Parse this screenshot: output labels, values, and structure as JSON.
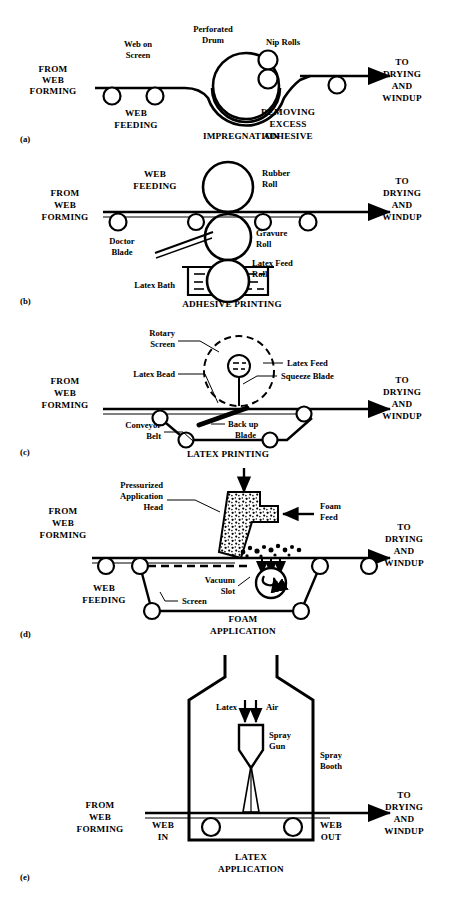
{
  "figure": {
    "background": "#ffffff",
    "ink": "#000000",
    "panel_count": 5
  },
  "common": {
    "input_label": [
      "FROM",
      "WEB",
      "FORMING"
    ],
    "output_label": [
      "TO",
      "DRYING",
      "AND",
      "WINDUP"
    ]
  },
  "panels": [
    {
      "id": "a",
      "tag": "(a)",
      "caption": "IMPREGNATION",
      "process": "impregnation",
      "labels": {
        "web_on_screen": "Web on\nScreen",
        "web_on_screen_l1": "Web on",
        "web_on_screen_l2": "Screen",
        "perforated_drum_l1": "Perforated",
        "perforated_drum_l2": "Drum",
        "nip_rolls": "Nip Rolls",
        "web_feeding_l1": "WEB",
        "web_feeding_l2": "FEEDING",
        "removing_l1": "REMOVING",
        "removing_l2": "EXCESS",
        "removing_l3": "ADHESIVE",
        "caption": "IMPREGNATION"
      }
    },
    {
      "id": "b",
      "tag": "(b)",
      "caption": "ADHESIVE  PRINTING",
      "process": "adhesive-printing",
      "labels": {
        "web_feeding_l1": "WEB",
        "web_feeding_l2": "FEEDING",
        "rubber_roll_l1": "Rubber",
        "rubber_roll_l2": "Roll",
        "gravure_roll_l1": "Gravure",
        "gravure_roll_l2": "Roll",
        "latex_feed_roll_l1": "Latex Feed",
        "latex_feed_roll_l2": "Roll",
        "doctor_blade_l1": "Doctor",
        "doctor_blade_l2": "Blade",
        "latex_bath": "Latex Bath",
        "caption": "ADHESIVE  PRINTING"
      }
    },
    {
      "id": "c",
      "tag": "(c)",
      "caption": "LATEX  PRINTING",
      "process": "latex-printing",
      "labels": {
        "rotary_screen_l1": "Rotary",
        "rotary_screen_l2": "Screen",
        "latex_feed": "Latex Feed",
        "latex_bead": "Latex Bead",
        "squeeze_blade": "Squeeze Blade",
        "back_up_blade_l1": "Back up",
        "back_up_blade_l2": "Blade",
        "conveyor_belt_l1": "Conveyor",
        "conveyor_belt_l2": "Belt",
        "caption": "LATEX  PRINTING"
      }
    },
    {
      "id": "d",
      "tag": "(d)",
      "caption_l1": "FOAM",
      "caption_l2": "APPLICATION",
      "process": "foam-application",
      "labels": {
        "pressurized_head_l1": "Pressurized",
        "pressurized_head_l2": "Application",
        "pressurized_head_l3": "Head",
        "foam_feed_l1": "Foam",
        "foam_feed_l2": "Feed",
        "vacuum_slot_l1": "Vacuum",
        "vacuum_slot_l2": "Slot",
        "screen": "Screen",
        "web_feeding_l1": "WEB",
        "web_feeding_l2": "FEEDING",
        "caption_l1": "FOAM",
        "caption_l2": "APPLICATION"
      }
    },
    {
      "id": "e",
      "tag": "(e)",
      "caption_l1": "LATEX",
      "caption_l2": "APPLICATION",
      "process": "latex-spray-application",
      "labels": {
        "latex": "Latex",
        "air": "Air",
        "spray_gun_l1": "Spray",
        "spray_gun_l2": "Gun",
        "spray_booth_l1": "Spray",
        "spray_booth_l2": "Booth",
        "web_in_l1": "WEB",
        "web_in_l2": "IN",
        "web_out_l1": "WEB",
        "web_out_l2": "OUT",
        "caption_l1": "LATEX",
        "caption_l2": "APPLICATION"
      }
    }
  ]
}
